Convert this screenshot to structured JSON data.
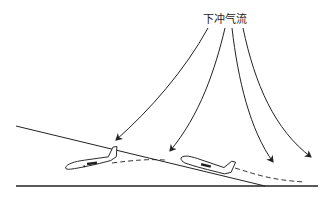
{
  "diagram": {
    "title_label": "下冲气流",
    "elements": {
      "downdraft_arrows": 4,
      "aircraft": 2,
      "glideslope": "solid line descending to runway",
      "flight_path": "dashed line showing deviation below glideslope",
      "ground": "horizontal runway line"
    },
    "colors": {
      "stroke": "#222222",
      "background": "#ffffff"
    }
  }
}
